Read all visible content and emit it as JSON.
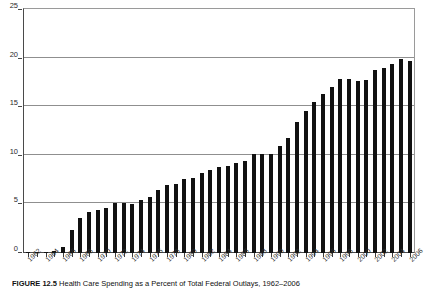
{
  "figure": {
    "caption_label": "FIGURE 12.5",
    "caption_body": "Health Care Spending as a Percent of Total Federal Outlays, 1962–2006",
    "caption_full": "FIGURE 12.5  Health Care Spending as a Percent of Total Federal Outlays, 1962–2006"
  },
  "chart_data": {
    "type": "bar",
    "title": "",
    "subtitle": "",
    "xlabel": "",
    "ylabel": "",
    "ylim": [
      0,
      25
    ],
    "yticks": [
      0,
      5,
      10,
      15,
      20,
      25
    ],
    "ytick_labels": [
      "0",
      "5",
      "10",
      "15",
      "20",
      "25"
    ],
    "grid": true,
    "grid_axis": "y",
    "legend": false,
    "legend_position": "none",
    "bar_color": "#111111",
    "categories": [
      "1962",
      "1963",
      "1964",
      "1965",
      "1966",
      "1967",
      "1968",
      "1969",
      "1970",
      "1971",
      "1972",
      "1973",
      "1974",
      "1975",
      "1976",
      "1977",
      "1978",
      "1979",
      "1980",
      "1981",
      "1982",
      "1983",
      "1984",
      "1985",
      "1986",
      "1987",
      "1988",
      "1989",
      "1990",
      "1991",
      "1992",
      "1993",
      "1994",
      "1995",
      "1996",
      "1997",
      "1998",
      "1999",
      "2000",
      "2001",
      "2002",
      "2003",
      "2004",
      "2005",
      "2006"
    ],
    "xtick_labels_shown": [
      "1962",
      "1964",
      "1966",
      "1968",
      "1970",
      "1972",
      "1974",
      "1976",
      "1978",
      "1980",
      "1982",
      "1984",
      "1986",
      "1988",
      "1990",
      "1992",
      "1994",
      "1996",
      "1998",
      "2000",
      "2002",
      "2004",
      "2006"
    ],
    "xtick_label_interval": 2,
    "xtick_label_rotation": -45,
    "values": [
      0.1,
      0.1,
      0.1,
      0.2,
      0.6,
      2.4,
      3.6,
      4.2,
      4.4,
      4.6,
      5.1,
      5.1,
      5.0,
      5.5,
      5.8,
      6.5,
      7.0,
      7.1,
      7.6,
      7.7,
      8.2,
      8.5,
      8.8,
      9.0,
      9.3,
      9.5,
      10.2,
      10.2,
      10.2,
      11.0,
      11.8,
      13.5,
      14.6,
      15.5,
      16.4,
      17.1,
      17.9,
      17.9,
      17.7,
      17.8,
      18.8,
      19.0,
      19.4,
      20.0,
      19.8
    ],
    "value_unit": "percent",
    "series": [
      {
        "name": "Health care spending share of federal outlays",
        "values": [
          0.1,
          0.1,
          0.1,
          0.2,
          0.6,
          2.4,
          3.6,
          4.2,
          4.4,
          4.6,
          5.1,
          5.1,
          5.0,
          5.5,
          5.8,
          6.5,
          7.0,
          7.1,
          7.6,
          7.7,
          8.2,
          8.5,
          8.8,
          9.0,
          9.3,
          9.5,
          10.2,
          10.2,
          10.2,
          11.0,
          11.8,
          13.5,
          14.6,
          15.5,
          16.4,
          17.1,
          17.9,
          17.9,
          17.7,
          17.8,
          18.8,
          19.0,
          19.4,
          20.0,
          19.8
        ]
      }
    ]
  },
  "colors": {
    "bar": "#111111",
    "grid": "#8f8f8f",
    "axis": "#4a4a4a",
    "text": "#2b2b2b",
    "background": "#ffffff"
  }
}
